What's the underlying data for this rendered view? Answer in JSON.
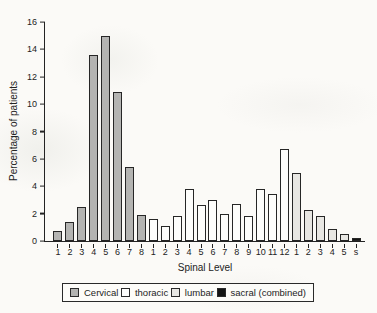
{
  "window": {
    "width": 377,
    "height": 313,
    "background": "#fbfaf7"
  },
  "chart_data": {
    "type": "bar",
    "title": "",
    "xlabel": "Spinal Level",
    "ylabel": "Percentage of patients",
    "ylim": [
      0,
      16
    ],
    "yticks": [
      0,
      2,
      4,
      6,
      8,
      10,
      12,
      14,
      16
    ],
    "grid": false,
    "legend_position": "bottom-outside",
    "bar_border_color": "#262626",
    "series": [
      {
        "name": "Cervical",
        "fill": "#b4b4b2",
        "categories": [
          "1",
          "2",
          "3",
          "4",
          "5",
          "6",
          "7",
          "8"
        ],
        "values": [
          0.7,
          1.4,
          2.5,
          13.6,
          15.0,
          10.9,
          5.4,
          1.9
        ]
      },
      {
        "name": "thoracic",
        "fill": "#fdfdfb",
        "categories": [
          "1",
          "2",
          "3",
          "4",
          "5",
          "6",
          "7",
          "8",
          "9",
          "10",
          "11",
          "12"
        ],
        "values": [
          1.6,
          1.1,
          1.8,
          3.8,
          2.6,
          3.0,
          2.0,
          2.7,
          1.8,
          3.8,
          3.4,
          6.7
        ]
      },
      {
        "name": "lumbar",
        "fill": "#e8e7e3",
        "categories": [
          "1",
          "2",
          "3",
          "4",
          "5"
        ],
        "values": [
          5.0,
          2.3,
          1.8,
          0.9,
          0.5
        ]
      },
      {
        "name": "sacral (combined)",
        "fill": "#141414",
        "categories": [
          "s"
        ],
        "values": [
          0.2
        ]
      }
    ]
  }
}
